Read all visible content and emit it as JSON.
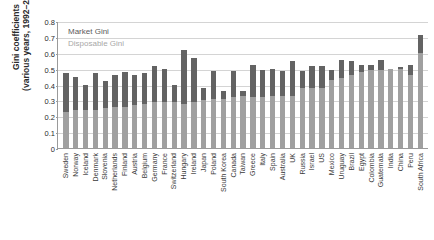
{
  "chart_data": {
    "type": "bar",
    "subtype": "stacked-bar",
    "title": "",
    "xlabel": "",
    "ylabel": "Gini coefficients\n(various years, 1992–2013)",
    "ylim": [
      0,
      0.8
    ],
    "ytick_labels": [
      "0.8",
      "0.7",
      "0.6",
      "0.5",
      "0.4",
      "0.3",
      "0.2",
      "0.1",
      "0"
    ],
    "ytick_values": [
      0.8,
      0.7,
      0.6,
      0.5,
      0.4,
      0.3,
      0.2,
      0.1,
      0
    ],
    "grid": true,
    "legend_position": "top-left-inside",
    "legend": [
      "Market Gini",
      "Disposable Gini"
    ],
    "colors": {
      "market": "#636363",
      "disposable": "#a0a0a0",
      "grid": "#d4d4d4",
      "axis": "#9a9a9a",
      "text": "#2b2b2b",
      "background": "#ffffff"
    },
    "categories": [
      "Sweden",
      "Norway",
      "Iceland",
      "Denmark",
      "Slovenia",
      "Netherlands",
      "Finland",
      "Austria",
      "Belgium",
      "Germany",
      "France",
      "Switzerland",
      "Hungary",
      "Ireland",
      "Japan",
      "Poland",
      "South Korea",
      "Canada",
      "Taiwan",
      "Greece",
      "Italy",
      "Spain",
      "Australia",
      "UK",
      "Russia",
      "Israel",
      "US",
      "Mexico",
      "Uruguay",
      "Brazil",
      "Egypt",
      "Colombia",
      "Guatemala",
      "India",
      "China",
      "Peru",
      "South Africa"
    ],
    "series": [
      {
        "name": "Disposable Gini",
        "values": [
          0.23,
          0.24,
          0.24,
          0.24,
          0.25,
          0.26,
          0.26,
          0.27,
          0.28,
          0.29,
          0.29,
          0.29,
          0.28,
          0.29,
          0.3,
          0.31,
          0.31,
          0.32,
          0.33,
          0.32,
          0.32,
          0.33,
          0.33,
          0.33,
          0.38,
          0.38,
          0.38,
          0.43,
          0.44,
          0.46,
          0.48,
          0.49,
          0.49,
          0.5,
          0.5,
          0.46,
          0.6
        ]
      },
      {
        "name": "Market Gini",
        "values": [
          0.47,
          0.45,
          0.4,
          0.47,
          0.42,
          0.46,
          0.48,
          0.46,
          0.475,
          0.515,
          0.5,
          0.395,
          0.615,
          0.57,
          0.38,
          0.485,
          0.36,
          0.485,
          0.36,
          0.52,
          0.49,
          0.495,
          0.485,
          0.55,
          0.485,
          0.515,
          0.515,
          0.49,
          0.555,
          0.55,
          0.52,
          0.525,
          0.555,
          0.5,
          0.51,
          0.525,
          0.71
        ]
      }
    ]
  }
}
